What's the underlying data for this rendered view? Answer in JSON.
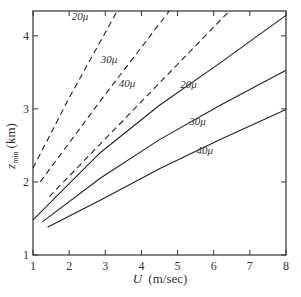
{
  "chart_data": {
    "type": "line",
    "title": "",
    "xlabel": "U (m/sec)",
    "ylabel": "z_min (km)",
    "xlim": [
      1,
      8
    ],
    "ylim": [
      1,
      4.34
    ],
    "xticks": [
      1,
      2,
      3,
      4,
      5,
      6,
      7,
      8
    ],
    "yticks": [
      1,
      2,
      3,
      4
    ],
    "grid": false,
    "legend": "inline labels",
    "series": [
      {
        "name": "20μ (dashed)",
        "style": "dashed",
        "label": "20μ",
        "points": [
          [
            1.0,
            2.19
          ],
          [
            2.0,
            3.15
          ],
          [
            3.33,
            4.34
          ]
        ]
      },
      {
        "name": "30μ (dashed)",
        "style": "dashed",
        "label": "30μ",
        "points": [
          [
            1.2,
            2.0
          ],
          [
            3.0,
            3.2
          ],
          [
            4.77,
            4.34
          ]
        ]
      },
      {
        "name": "40μ (dashed)",
        "style": "dashed",
        "label": "40μ",
        "points": [
          [
            1.45,
            1.8
          ],
          [
            4.0,
            3.1
          ],
          [
            6.43,
            4.34
          ]
        ]
      },
      {
        "name": "20μ (solid)",
        "style": "solid",
        "label": "20μ",
        "points": [
          [
            1.0,
            1.48
          ],
          [
            2.86,
            2.4
          ],
          [
            4.5,
            3.05
          ],
          [
            6.18,
            3.63
          ],
          [
            8.0,
            4.28
          ]
        ]
      },
      {
        "name": "30μ (solid)",
        "style": "solid",
        "label": "30μ",
        "points": [
          [
            1.25,
            1.45
          ],
          [
            2.86,
            2.05
          ],
          [
            4.5,
            2.58
          ],
          [
            6.18,
            3.05
          ],
          [
            8.0,
            3.53
          ]
        ]
      },
      {
        "name": "40μ (solid)",
        "style": "solid",
        "label": "40μ",
        "points": [
          [
            1.4,
            1.38
          ],
          [
            2.86,
            1.75
          ],
          [
            4.5,
            2.18
          ],
          [
            6.18,
            2.58
          ],
          [
            8.0,
            2.99
          ]
        ]
      }
    ],
    "annotations": [
      {
        "text": "20μ",
        "at": [
          2.3,
          4.22
        ]
      },
      {
        "text": "30μ",
        "at": [
          3.1,
          3.63
        ]
      },
      {
        "text": "40μ",
        "at": [
          3.6,
          3.3
        ]
      },
      {
        "text": "20μ",
        "at": [
          5.3,
          3.28
        ]
      },
      {
        "text": "30μ",
        "at": [
          5.55,
          2.78
        ]
      },
      {
        "text": "40μ",
        "at": [
          5.75,
          2.38
        ]
      }
    ]
  },
  "axes": {
    "x_label_italic": "U",
    "x_label_unit": "(m/sec)",
    "y_label_main": "z",
    "y_label_sub": "min",
    "y_label_unit": "(km)"
  }
}
